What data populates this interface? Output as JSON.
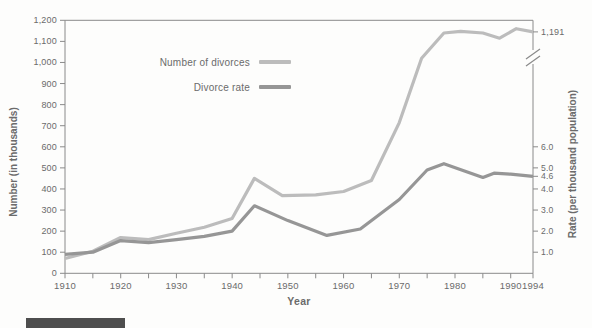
{
  "figure": {
    "background": "#fdfdfc",
    "axis_color": "#8a8a8a",
    "text_color": "#6b6b6b",
    "footer_box_color": "#4e4e4e"
  },
  "legend": {
    "items": [
      {
        "label": "Number of divorces"
      },
      {
        "label": "Divorce rate"
      }
    ]
  },
  "axes": {
    "x": {
      "title": "Year",
      "min": 1910,
      "max": 1994,
      "labeled_ticks": [
        {
          "year": 1910,
          "label": "1910"
        },
        {
          "year": 1920,
          "label": "1920"
        },
        {
          "year": 1930,
          "label": "1930"
        },
        {
          "year": 1940,
          "label": "1940"
        },
        {
          "year": 1950,
          "label": "1950"
        },
        {
          "year": 1960,
          "label": "1960"
        },
        {
          "year": 1970,
          "label": "1970"
        },
        {
          "year": 1980,
          "label": "1980"
        },
        {
          "year": 1990,
          "label": "1990"
        },
        {
          "year": 1994,
          "label": "1994"
        }
      ],
      "minor_tick_years": [
        1915,
        1925,
        1935,
        1945,
        1955,
        1965,
        1975,
        1985
      ]
    },
    "y_left": {
      "title": "Number (in thousands)",
      "min": 0,
      "max": 1200,
      "ticks": [
        {
          "value": 0,
          "label": "0"
        },
        {
          "value": 100,
          "label": "100"
        },
        {
          "value": 200,
          "label": "200"
        },
        {
          "value": 300,
          "label": "300"
        },
        {
          "value": 400,
          "label": "400"
        },
        {
          "value": 500,
          "label": "500"
        },
        {
          "value": 600,
          "label": "600"
        },
        {
          "value": 700,
          "label": "700"
        },
        {
          "value": 800,
          "label": "800"
        },
        {
          "value": 900,
          "label": "900"
        },
        {
          "value": 1000,
          "label": "1,000"
        },
        {
          "value": 1100,
          "label": "1,100"
        },
        {
          "value": 1200,
          "label": "1,200"
        }
      ]
    },
    "y_right": {
      "title": "Rate (per thousand population)",
      "visible_max": 6.0,
      "units_full_height": 12,
      "has_axis_break": true,
      "ticks": [
        {
          "value": 1.0,
          "label": "1.0"
        },
        {
          "value": 2.0,
          "label": "2.0"
        },
        {
          "value": 3.0,
          "label": "3.0"
        },
        {
          "value": 4.0,
          "label": "4.0"
        },
        {
          "value": 4.6,
          "label": "4.6"
        },
        {
          "value": 5.0,
          "label": "5.0"
        },
        {
          "value": 6.0,
          "label": "6.0"
        }
      ]
    }
  },
  "chart_data": {
    "type": "line",
    "title": "",
    "xlabel": "Year",
    "ylabel_left": "Number (in thousands)",
    "ylabel_right": "Rate (per thousand population)",
    "x_range": [
      1910,
      1994
    ],
    "y_left_range": [
      0,
      1200
    ],
    "y_right_visible_range": [
      0,
      6.0
    ],
    "grid": false,
    "legend_position": "inside-upper-left",
    "series": [
      {
        "name": "Number of divorces",
        "axis": "left",
        "color": "#bcbcbc",
        "stroke_width": 3.2,
        "end_value_label": "1,191",
        "points": [
          [
            1910,
            70
          ],
          [
            1915,
            105
          ],
          [
            1920,
            170
          ],
          [
            1925,
            160
          ],
          [
            1930,
            190
          ],
          [
            1935,
            218
          ],
          [
            1940,
            260
          ],
          [
            1944,
            450
          ],
          [
            1949,
            368
          ],
          [
            1955,
            372
          ],
          [
            1960,
            388
          ],
          [
            1965,
            440
          ],
          [
            1970,
            715
          ],
          [
            1974,
            1020
          ],
          [
            1978,
            1140
          ],
          [
            1981,
            1148
          ],
          [
            1985,
            1140
          ],
          [
            1988,
            1115
          ],
          [
            1991,
            1160
          ],
          [
            1994,
            1145
          ]
        ]
      },
      {
        "name": "Divorce rate",
        "axis": "right",
        "color": "#969696",
        "stroke_width": 3.2,
        "end_value_label": "4.6",
        "points": [
          [
            1910,
            0.9
          ],
          [
            1915,
            1.0
          ],
          [
            1920,
            1.55
          ],
          [
            1925,
            1.45
          ],
          [
            1930,
            1.6
          ],
          [
            1935,
            1.75
          ],
          [
            1940,
            2.0
          ],
          [
            1944,
            3.2
          ],
          [
            1950,
            2.5
          ],
          [
            1957,
            1.8
          ],
          [
            1963,
            2.1
          ],
          [
            1970,
            3.5
          ],
          [
            1975,
            4.9
          ],
          [
            1978,
            5.2
          ],
          [
            1985,
            4.55
          ],
          [
            1987,
            4.75
          ],
          [
            1990,
            4.7
          ],
          [
            1994,
            4.6
          ]
        ]
      }
    ]
  }
}
